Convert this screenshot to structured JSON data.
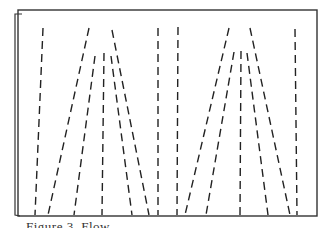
{
  "figure": {
    "frame": {
      "left": 18,
      "top": 10,
      "right": 317,
      "bottom": 216,
      "back_offset": 4,
      "stroke": "#333333"
    },
    "line_style": {
      "stroke": "#222222",
      "width": 1.4,
      "dash": "8 5"
    },
    "lines": [
      {
        "id": "left-outer-vertical",
        "x1": 43,
        "y1": 28,
        "x2": 35,
        "y2": 215
      },
      {
        "id": "left-fan-outer-left",
        "x1": 89,
        "y1": 28,
        "x2": 48,
        "y2": 215
      },
      {
        "id": "left-fan-outer-right",
        "x1": 112,
        "y1": 30,
        "x2": 149,
        "y2": 215
      },
      {
        "id": "left-fan-inner-left",
        "x1": 95,
        "y1": 56,
        "x2": 74,
        "y2": 215
      },
      {
        "id": "left-fan-inner-center",
        "x1": 104,
        "y1": 53,
        "x2": 102,
        "y2": 215
      },
      {
        "id": "left-fan-inner-right",
        "x1": 111,
        "y1": 56,
        "x2": 132,
        "y2": 215
      },
      {
        "id": "center-vertical-left",
        "x1": 158,
        "y1": 28,
        "x2": 158,
        "y2": 215
      },
      {
        "id": "center-vertical-right",
        "x1": 178,
        "y1": 27,
        "x2": 177,
        "y2": 215
      },
      {
        "id": "right-fan-outer-left",
        "x1": 229,
        "y1": 28,
        "x2": 185,
        "y2": 215
      },
      {
        "id": "right-fan-outer-right",
        "x1": 250,
        "y1": 28,
        "x2": 290,
        "y2": 215
      },
      {
        "id": "right-fan-inner-left",
        "x1": 234,
        "y1": 52,
        "x2": 206,
        "y2": 215
      },
      {
        "id": "right-fan-inner-center",
        "x1": 241,
        "y1": 51,
        "x2": 240,
        "y2": 215
      },
      {
        "id": "right-fan-inner-right",
        "x1": 247,
        "y1": 53,
        "x2": 268,
        "y2": 215
      },
      {
        "id": "right-outer-vertical",
        "x1": 295,
        "y1": 29,
        "x2": 297,
        "y2": 215
      }
    ],
    "caption": "Figure 3.  Flow..."
  }
}
